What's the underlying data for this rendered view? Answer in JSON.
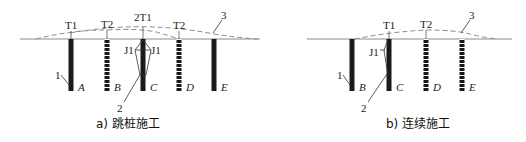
{
  "figure": {
    "panel_a": {
      "caption": "a) 跳桩施工",
      "piles": [
        {
          "label": "A",
          "x": 71,
          "style": "solid"
        },
        {
          "label": "B",
          "x": 107,
          "style": "segmented"
        },
        {
          "label": "C",
          "x": 143,
          "style": "solid"
        },
        {
          "label": "D",
          "x": 179,
          "style": "segmented"
        },
        {
          "label": "E",
          "x": 214,
          "style": "solid"
        }
      ],
      "top_labels": [
        {
          "text": "T1",
          "x": 71
        },
        {
          "text": "T2",
          "x": 107
        },
        {
          "text": "2T1",
          "x": 143
        },
        {
          "text": "T2",
          "x": 179
        }
      ],
      "j_labels": [
        "J1",
        "J1"
      ],
      "callouts": {
        "pile": "1",
        "bulb": "2",
        "heave": "3"
      }
    },
    "panel_b": {
      "caption": "b) 连续施工",
      "piles": [
        {
          "label": "B",
          "x": 352,
          "style": "solid"
        },
        {
          "label": "C",
          "x": 389,
          "style": "solid"
        },
        {
          "label": "D",
          "x": 426,
          "style": "segmented"
        },
        {
          "label": "E",
          "x": 462,
          "style": "segmented"
        }
      ],
      "top_labels": [
        {
          "text": "T1",
          "x": 389
        },
        {
          "text": "T2",
          "x": 426
        }
      ],
      "j_labels": [
        "J1"
      ],
      "callouts": {
        "pile": "1",
        "bulb": "2",
        "heave": "3"
      }
    },
    "colors": {
      "pile": "#1a1a1a",
      "ground": "#8a8a8a",
      "text": "#222222"
    }
  }
}
